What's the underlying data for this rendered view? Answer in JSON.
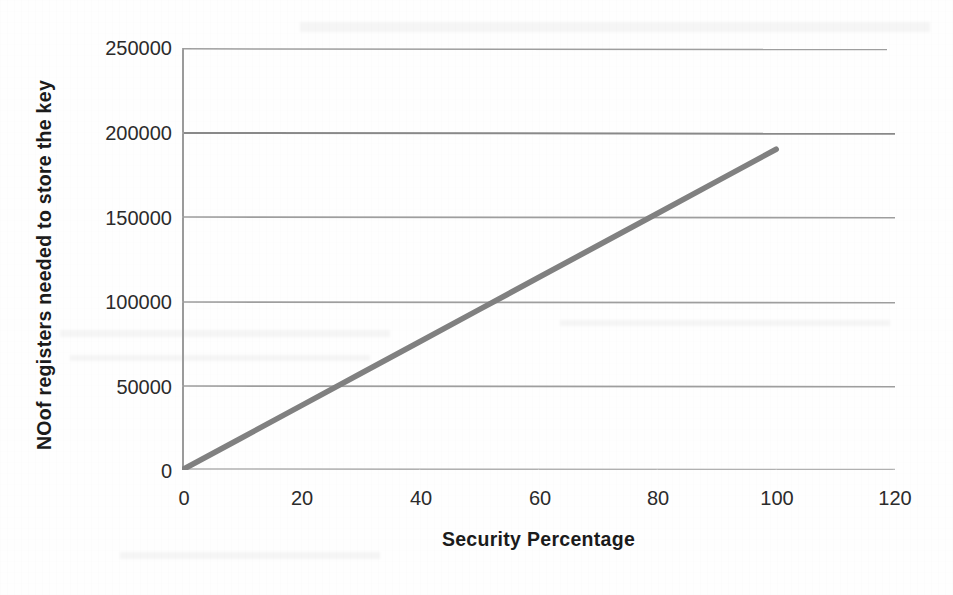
{
  "chart_data": {
    "type": "line",
    "title": "",
    "xlabel": "Security Percentage",
    "ylabel": "NOof registers needed to store the key",
    "xlim": [
      0,
      120
    ],
    "ylim": [
      0,
      250000
    ],
    "xticks": [
      "0",
      "20",
      "40",
      "60",
      "80",
      "100",
      "120"
    ],
    "xtick_values": [
      0,
      20,
      40,
      60,
      80,
      100,
      120
    ],
    "yticks": [
      "0",
      "50000",
      "100000",
      "150000",
      "200000",
      "250000"
    ],
    "ytick_values": [
      0,
      50000,
      100000,
      150000,
      200000,
      250000
    ],
    "grid": "horizontal",
    "legend": "none",
    "series": [
      {
        "name": "registers needed",
        "color": "#808080",
        "x": [
          0,
          10,
          20,
          30,
          40,
          50,
          60,
          70,
          80,
          90,
          100
        ],
        "values": [
          0,
          19000,
          38000,
          57000,
          76000,
          95000,
          114000,
          133000,
          152000,
          171000,
          190000
        ]
      }
    ],
    "annotations": []
  },
  "axes": {
    "y_title": "NOof registers needed to store the key",
    "x_title": "Security Percentage",
    "y_ticks": [
      {
        "label": "250000",
        "value": 250000
      },
      {
        "label": "200000",
        "value": 200000
      },
      {
        "label": "150000",
        "value": 150000
      },
      {
        "label": "100000",
        "value": 100000
      },
      {
        "label": "50000",
        "value": 50000
      },
      {
        "label": "0",
        "value": 0
      }
    ],
    "x_ticks": [
      {
        "label": "0",
        "value": 0
      },
      {
        "label": "20",
        "value": 20
      },
      {
        "label": "40",
        "value": 40
      },
      {
        "label": "60",
        "value": 60
      },
      {
        "label": "80",
        "value": 80
      },
      {
        "label": "100",
        "value": 100
      },
      {
        "label": "120",
        "value": 120
      }
    ]
  },
  "colors": {
    "background": "#fefefe",
    "series_line": "#808080",
    "gridline": "#8c8c8c",
    "axis_line": "#9a9a9a",
    "text": "#231f20"
  }
}
